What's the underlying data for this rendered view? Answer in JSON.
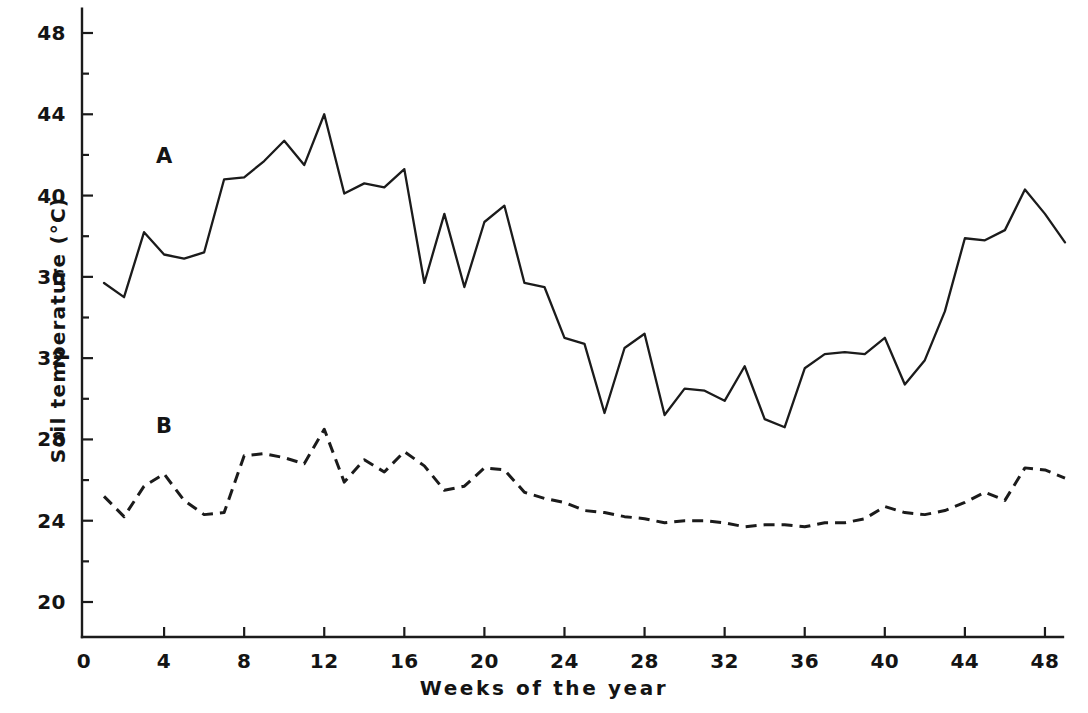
{
  "chart_data": {
    "type": "line",
    "title": "",
    "xlabel": "Weeks of the year",
    "ylabel": "Soil temperature (°C)",
    "xlim": [
      0,
      49
    ],
    "ylim": [
      18.2,
      49.2
    ],
    "xticks": [
      0,
      4,
      8,
      12,
      16,
      20,
      24,
      28,
      32,
      36,
      40,
      44,
      48
    ],
    "yticks": [
      20,
      24,
      28,
      32,
      36,
      40,
      44,
      48
    ],
    "xticklabels": [
      "0",
      "4",
      "8",
      "12",
      "16",
      "20",
      "24",
      "28",
      "32",
      "36",
      "40",
      "44",
      "48"
    ],
    "yticklabels": [
      "20",
      "24",
      "28",
      "32",
      "36",
      "40",
      "44",
      "48"
    ],
    "grid": false,
    "legend_position": "inline-annotation",
    "annotations": [
      {
        "label": "A",
        "x": 4.0,
        "y": 41.9
      },
      {
        "label": "B",
        "x": 4.0,
        "y": 28.6
      }
    ],
    "x": [
      1,
      2,
      3,
      4,
      5,
      6,
      7,
      8,
      9,
      10,
      11,
      12,
      13,
      14,
      15,
      16,
      17,
      18,
      19,
      20,
      21,
      22,
      23,
      24,
      25,
      26,
      27,
      28,
      29,
      30,
      31,
      32,
      33,
      34,
      35,
      36,
      37,
      38,
      39,
      40,
      41,
      42,
      43,
      44,
      45,
      46,
      47,
      48,
      49
    ],
    "series": [
      {
        "name": "A",
        "style": "solid",
        "color": "#1b1b1b",
        "values": [
          35.7,
          35.0,
          38.2,
          37.1,
          36.9,
          37.2,
          40.8,
          40.9,
          41.7,
          42.7,
          41.5,
          44.0,
          40.1,
          40.6,
          40.4,
          41.3,
          35.7,
          39.1,
          35.5,
          38.7,
          39.5,
          35.7,
          35.5,
          33.0,
          32.7,
          29.3,
          32.5,
          33.2,
          29.2,
          30.5,
          30.4,
          29.9,
          31.6,
          29.0,
          28.6,
          31.5,
          32.2,
          32.3,
          32.2,
          33.0,
          30.7,
          31.9,
          34.3,
          37.9,
          37.8,
          38.3,
          40.3,
          39.1,
          37.7
        ]
      },
      {
        "name": "B",
        "style": "dashed",
        "color": "#1b1b1b",
        "values": [
          25.2,
          24.2,
          25.7,
          26.3,
          25.0,
          24.3,
          24.4,
          27.2,
          27.3,
          27.1,
          26.8,
          28.5,
          25.9,
          27.0,
          26.4,
          27.4,
          26.7,
          25.5,
          25.7,
          26.6,
          26.5,
          25.4,
          25.1,
          24.9,
          24.5,
          24.4,
          24.2,
          24.1,
          23.9,
          24.0,
          24.0,
          23.9,
          23.7,
          23.8,
          23.8,
          23.7,
          23.9,
          23.9,
          24.1,
          24.7,
          24.4,
          24.3,
          24.5,
          24.9,
          25.4,
          25.0,
          26.6,
          26.5,
          26.1
        ]
      }
    ]
  },
  "axes": {
    "y_title": "Soil temperature (°C)",
    "x_title": "Weeks  of  the  year"
  },
  "labels": {
    "series_a": "A",
    "series_b": "B"
  }
}
